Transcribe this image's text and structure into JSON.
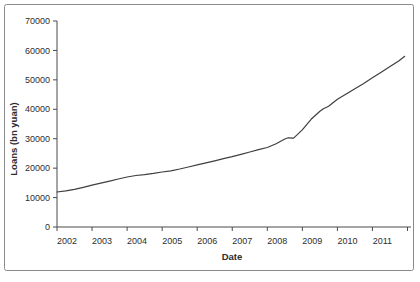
{
  "figure": {
    "background": "#ffffff",
    "border_color": "#8a8a8a",
    "axis_color": "#4a4a4a",
    "line_color": "#3f3f3f",
    "text_color": "#2e2e2e"
  },
  "chart_data": {
    "type": "line",
    "title": "",
    "xlabel": "Date",
    "ylabel": "Loans (bn yuan)",
    "grid": false,
    "legend": "none",
    "ylim": [
      0,
      70000
    ],
    "y_ticks": [
      0,
      10000,
      20000,
      30000,
      40000,
      50000,
      60000,
      70000
    ],
    "x_tick_years": [
      2002,
      2003,
      2004,
      2005,
      2006,
      2007,
      2008,
      2009,
      2010,
      2011
    ],
    "x_range": [
      2002,
      2012.1
    ],
    "series": [
      {
        "name": "Loans outstanding",
        "x": [
          2002.0,
          2002.25,
          2002.5,
          2002.75,
          2003.0,
          2003.25,
          2003.5,
          2003.75,
          2004.0,
          2004.25,
          2004.5,
          2004.75,
          2005.0,
          2005.25,
          2005.5,
          2005.75,
          2006.0,
          2006.25,
          2006.5,
          2006.75,
          2007.0,
          2007.25,
          2007.5,
          2007.75,
          2008.0,
          2008.25,
          2008.5,
          2008.6,
          2008.75,
          2009.0,
          2009.25,
          2009.5,
          2009.6,
          2009.75,
          2010.0,
          2010.25,
          2010.5,
          2010.75,
          2011.0,
          2011.25,
          2011.5,
          2011.75,
          2011.92
        ],
        "values": [
          11900,
          12300,
          12800,
          13500,
          14200,
          14900,
          15600,
          16300,
          17000,
          17500,
          17800,
          18200,
          18700,
          19100,
          19700,
          20400,
          21100,
          21800,
          22500,
          23200,
          23900,
          24700,
          25500,
          26300,
          27000,
          28300,
          29900,
          30300,
          30200,
          33000,
          36600,
          39300,
          40200,
          41000,
          43400,
          45200,
          47000,
          48800,
          50700,
          52600,
          54500,
          56400,
          58000
        ]
      }
    ]
  }
}
